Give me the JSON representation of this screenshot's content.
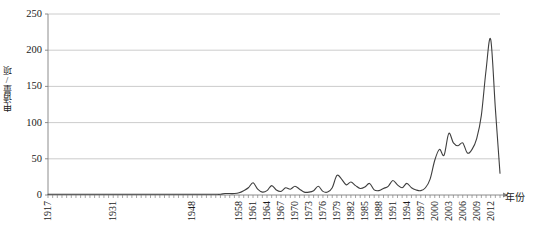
{
  "chart_data": {
    "type": "line",
    "title": "",
    "xlabel": "年份",
    "ylabel": "申请量/项",
    "ylim": [
      0,
      250
    ],
    "yticks": [
      0,
      50,
      100,
      150,
      200,
      250
    ],
    "ytick_labels": [
      "0",
      "50",
      "100",
      "150",
      "200",
      "250"
    ],
    "grid": "horizontal",
    "legend": "none",
    "line_color": "#3f3f3f",
    "gridline_color": "#bfbfbf",
    "axis_color": "#808080",
    "xtick_labels": [
      "1917",
      "1931",
      "1948",
      "1958",
      "1961",
      "1964",
      "1967",
      "1970",
      "1973",
      "1976",
      "1979",
      "1982",
      "1985",
      "1988",
      "1991",
      "1994",
      "1997",
      "2000",
      "2003",
      "2006",
      "2009",
      "2012"
    ],
    "x": [
      1917,
      1918,
      1919,
      1920,
      1921,
      1922,
      1923,
      1924,
      1925,
      1926,
      1927,
      1928,
      1929,
      1930,
      1931,
      1932,
      1933,
      1934,
      1935,
      1936,
      1937,
      1938,
      1939,
      1940,
      1941,
      1942,
      1943,
      1944,
      1945,
      1946,
      1947,
      1948,
      1949,
      1950,
      1951,
      1952,
      1953,
      1954,
      1955,
      1956,
      1957,
      1958,
      1959,
      1960,
      1961,
      1962,
      1963,
      1964,
      1965,
      1966,
      1967,
      1968,
      1969,
      1970,
      1971,
      1972,
      1973,
      1974,
      1975,
      1976,
      1977,
      1978,
      1979,
      1980,
      1981,
      1982,
      1983,
      1984,
      1985,
      1986,
      1987,
      1988,
      1989,
      1990,
      1991,
      1992,
      1993,
      1994,
      1995,
      1996,
      1997,
      1998,
      1999,
      2000,
      2001,
      2002,
      2003,
      2004,
      2005,
      2006,
      2007,
      2008,
      2009,
      2010,
      2011,
      2012,
      2013,
      2014
    ],
    "values": [
      1,
      1,
      1,
      1,
      1,
      1,
      1,
      1,
      1,
      1,
      1,
      1,
      1,
      1,
      1,
      1,
      1,
      1,
      1,
      1,
      1,
      1,
      1,
      1,
      1,
      1,
      1,
      1,
      1,
      1,
      1,
      1,
      1,
      1,
      1,
      1,
      1,
      1,
      2,
      2,
      2,
      3,
      6,
      10,
      17,
      8,
      4,
      6,
      13,
      7,
      5,
      10,
      8,
      12,
      8,
      4,
      4,
      6,
      12,
      5,
      4,
      10,
      27,
      22,
      14,
      18,
      13,
      9,
      11,
      16,
      7,
      6,
      9,
      12,
      20,
      14,
      10,
      16,
      10,
      7,
      6,
      10,
      22,
      48,
      63,
      55,
      85,
      72,
      68,
      72,
      58,
      63,
      78,
      110,
      172,
      215,
      120,
      30
    ],
    "peak": {
      "year": 2012,
      "value": 215
    },
    "secondary_peaks": [
      {
        "year": 2003,
        "value": 85
      },
      {
        "year": 2000,
        "value": 63
      },
      {
        "year": 2010,
        "value": 110
      },
      {
        "year": 1979,
        "value": 27
      }
    ]
  }
}
